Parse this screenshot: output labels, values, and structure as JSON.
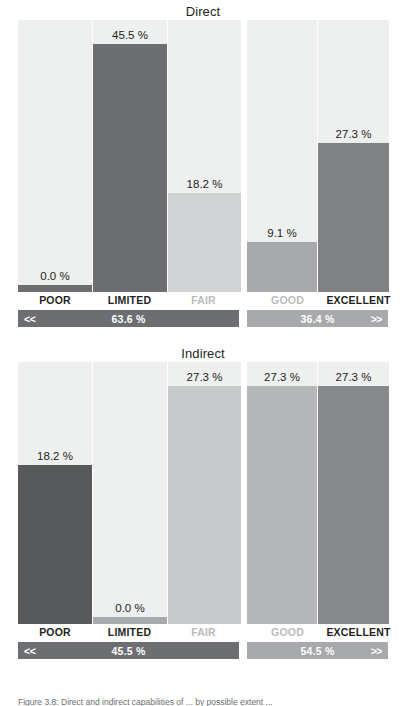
{
  "figure": {
    "caption": "Figure 3.8: Direct and indirect capabilities of ... by possible extent ...",
    "colors": {
      "panel_background": "#eeefef",
      "bar_dark": "#6d6e71",
      "bar_darkest": "#58595b",
      "bar_medium": "#a7a9ac",
      "bar_light": "#d1d3d4",
      "bar_lighter": "#c7c9cb",
      "summary_left": "#6d6e71",
      "summary_right": "#a7a9ac",
      "label_dark": "#231f20",
      "label_muted": "#b9bbbd"
    },
    "categories": [
      "POOR",
      "LIMITED",
      "FAIR",
      "GOOD",
      "EXCELLENT"
    ],
    "arrows": {
      "left": "<<",
      "right": ">>"
    }
  },
  "chart_data": [
    {
      "type": "bar",
      "title": "Direct",
      "xlabel": "",
      "ylabel": "",
      "ylim": [
        0,
        50
      ],
      "grid": false,
      "categories": [
        "POOR",
        "LIMITED",
        "FAIR",
        "GOOD",
        "EXCELLENT"
      ],
      "values": [
        0.0,
        45.5,
        18.2,
        9.1,
        27.3
      ],
      "value_labels": [
        "0.0 %",
        "45.5 %",
        "18.2 %",
        "9.1 %",
        "27.3 %"
      ],
      "group_totals": {
        "left_label": "63.6 %",
        "right_label": "36.4 %",
        "left": 63.6,
        "right": 36.4
      },
      "group_split": {
        "left": [
          "POOR",
          "LIMITED",
          "FAIR"
        ],
        "right": [
          "GOOD",
          "EXCELLENT"
        ]
      },
      "bar_colors": [
        "#6d6e71",
        "#6d6e71",
        "#d1d3d4",
        "#a7a9ac",
        "#808284"
      ],
      "category_muted": [
        false,
        false,
        true,
        true,
        false
      ]
    },
    {
      "type": "bar",
      "title": "Indirect",
      "xlabel": "",
      "ylabel": "",
      "ylim": [
        0,
        30
      ],
      "grid": false,
      "categories": [
        "POOR",
        "LIMITED",
        "FAIR",
        "GOOD",
        "EXCELLENT"
      ],
      "values": [
        18.2,
        0.0,
        27.3,
        27.3,
        27.3
      ],
      "value_labels": [
        "18.2 %",
        "0.0 %",
        "27.3 %",
        "27.3 %",
        "27.3 %"
      ],
      "group_totals": {
        "left_label": "45.5 %",
        "right_label": "54.5 %",
        "left": 45.5,
        "right": 54.5
      },
      "group_split": {
        "left": [
          "POOR",
          "LIMITED",
          "FAIR"
        ],
        "right": [
          "GOOD",
          "EXCELLENT"
        ]
      },
      "bar_colors": [
        "#58595b",
        "#a7a9ac",
        "#c7c9cb",
        "#b5b7b9",
        "#88898c"
      ],
      "category_muted": [
        false,
        false,
        true,
        true,
        false
      ]
    }
  ]
}
